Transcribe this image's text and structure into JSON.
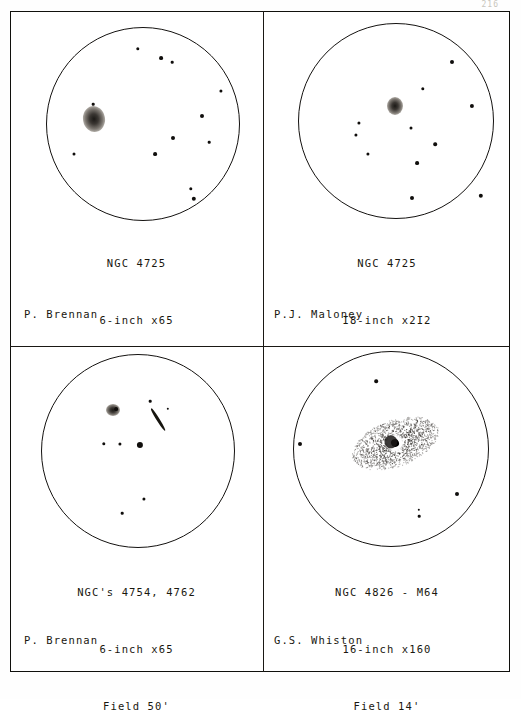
{
  "page": {
    "page_number_faint": "216",
    "frame_color": "#141210",
    "ink_color": "#19170f",
    "paper_color": "#ffffff"
  },
  "panels": [
    {
      "id": "panel-ngc4725-6inch",
      "object": "NGC 4725",
      "instrument": "6-inch x65",
      "field": "Field 50'",
      "observer": "P. Brennan",
      "sky": {
        "cx": 133,
        "cy": 113,
        "r": 97
      },
      "nebula": {
        "x": 84,
        "y": 108,
        "rx": 11,
        "ry": 13,
        "type": "diffuse-oval",
        "angle": -10
      },
      "stars": [
        {
          "x": 128,
          "y": 38,
          "r": 1.7
        },
        {
          "x": 151,
          "y": 47,
          "r": 1.9
        },
        {
          "x": 162,
          "y": 51,
          "r": 1.3
        },
        {
          "x": 211,
          "y": 80,
          "r": 1.6
        },
        {
          "x": 192,
          "y": 105,
          "r": 2.0
        },
        {
          "x": 83,
          "y": 93,
          "r": 1.3
        },
        {
          "x": 163,
          "y": 127,
          "r": 2.0
        },
        {
          "x": 199,
          "y": 131,
          "r": 1.3
        },
        {
          "x": 145,
          "y": 143,
          "r": 1.9
        },
        {
          "x": 64,
          "y": 143,
          "r": 1.5
        },
        {
          "x": 181,
          "y": 178,
          "r": 1.7
        },
        {
          "x": 184,
          "y": 188,
          "r": 2.2
        }
      ],
      "caption_top": 205,
      "observer_pos": {
        "x": 14,
        "y": 297
      }
    },
    {
      "id": "panel-ngc4725-18inch",
      "object": "NGC 4725",
      "instrument": "I8-inch x2I2",
      "field": "Field I2'",
      "observer": "P.J. Maloney",
      "sky": {
        "cx": 132,
        "cy": 110,
        "r": 98
      },
      "nebula": {
        "x": 131,
        "y": 95,
        "rx": 8,
        "ry": 9,
        "type": "compact-core",
        "angle": 0
      },
      "stars": [
        {
          "x": 188,
          "y": 51,
          "r": 2.0
        },
        {
          "x": 159,
          "y": 78,
          "r": 1.7
        },
        {
          "x": 208,
          "y": 95,
          "r": 2.1
        },
        {
          "x": 147,
          "y": 117,
          "r": 1.5
        },
        {
          "x": 95,
          "y": 112,
          "r": 1.6
        },
        {
          "x": 92,
          "y": 124,
          "r": 1.6
        },
        {
          "x": 171,
          "y": 133,
          "r": 1.8
        },
        {
          "x": 153,
          "y": 152,
          "r": 1.9
        },
        {
          "x": 104,
          "y": 143,
          "r": 1.6
        },
        {
          "x": 148,
          "y": 187,
          "r": 2.0
        },
        {
          "x": 217,
          "y": 185,
          "r": 2.2
        }
      ],
      "caption_top": 205,
      "observer_pos": {
        "x": 10,
        "y": 297
      }
    },
    {
      "id": "panel-ngc4754-4762",
      "object": "NGC's 4754, 4762",
      "instrument": "6-inch x65",
      "field": "Field 50'",
      "observer": "P. Brennan",
      "sky": {
        "cx": 128,
        "cy": 104,
        "r": 97
      },
      "nebula": {
        "x": 103,
        "y": 63,
        "rx": 7,
        "ry": 6,
        "type": "small-oval",
        "angle": 0
      },
      "streak": {
        "x": 148,
        "y": 73,
        "length": 26,
        "thickness": 3.2,
        "angle": 58
      },
      "stars": [
        {
          "x": 106,
          "y": 62,
          "r": 1.9
        },
        {
          "x": 158,
          "y": 62,
          "r": 1.2
        },
        {
          "x": 140,
          "y": 54,
          "r": 1.3
        },
        {
          "x": 94,
          "y": 97,
          "r": 1.7
        },
        {
          "x": 110,
          "y": 97,
          "r": 1.6
        },
        {
          "x": 130,
          "y": 98,
          "r": 3.1
        },
        {
          "x": 134,
          "y": 152,
          "r": 1.6
        },
        {
          "x": 112,
          "y": 166,
          "r": 1.3
        }
      ],
      "caption_top": 198,
      "observer_pos": {
        "x": 14,
        "y": 287
      }
    },
    {
      "id": "panel-ngc4826-m64",
      "object": "NGC 4826 - M64",
      "instrument": "16-inch x160",
      "field": "Field 14'",
      "observer": "G.S. Whiston",
      "sky": {
        "cx": 127,
        "cy": 102,
        "r": 98
      },
      "nebula": {
        "x": 131,
        "y": 96,
        "rx": 45,
        "ry": 23,
        "type": "stippled-ellipse-with-dustlane",
        "angle": -20
      },
      "stars": [
        {
          "x": 112,
          "y": 34,
          "r": 1.8
        },
        {
          "x": 36,
          "y": 97,
          "r": 2.0
        },
        {
          "x": 193,
          "y": 147,
          "r": 2.0
        },
        {
          "x": 155,
          "y": 163,
          "r": 1.2
        },
        {
          "x": 155,
          "y": 169,
          "r": 1.3
        }
      ],
      "caption_top": 198,
      "observer_pos": {
        "x": 10,
        "y": 287
      }
    }
  ]
}
